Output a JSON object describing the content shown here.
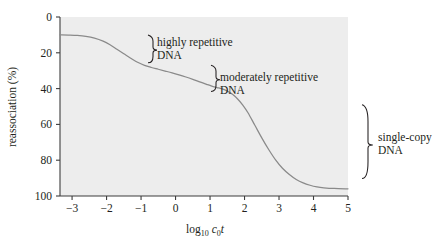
{
  "chart_data": {
    "type": "line",
    "title": "",
    "xlabel": "log10 c0t",
    "ylabel": "reassociation (%)",
    "xlim": [
      -3.35,
      5.0
    ],
    "ylim": [
      0,
      100
    ],
    "y_axis_inverted": true,
    "grid": false,
    "legend_position": "none",
    "xticks": [
      -3,
      -2,
      -1,
      0,
      1,
      2,
      3,
      4,
      5
    ],
    "xtick_labels": [
      "−3",
      "−2",
      "−1",
      "0",
      "1",
      "2",
      "3",
      "4",
      "5"
    ],
    "yticks": [
      0,
      20,
      40,
      60,
      80,
      100
    ],
    "ytick_labels": [
      "0",
      "20",
      "40",
      "60",
      "80",
      "100"
    ],
    "series": [
      {
        "name": "reassociation curve",
        "color": "#8a8a8a",
        "x": [
          -3.35,
          -3.1,
          -2.85,
          -2.6,
          -2.35,
          -2.1,
          -1.9,
          -1.7,
          -1.5,
          -1.3,
          -1.1,
          -0.9,
          -0.7,
          -0.5,
          -0.3,
          -0.1,
          0.1,
          0.3,
          0.5,
          0.7,
          0.9,
          1.05,
          1.2,
          1.35,
          1.5,
          1.65,
          1.8,
          1.95,
          2.1,
          2.3,
          2.5,
          2.7,
          2.9,
          3.1,
          3.3,
          3.5,
          3.7,
          3.9,
          4.1,
          4.3,
          4.6,
          5.0
        ],
        "y": [
          10.0,
          10.1,
          10.3,
          10.8,
          11.8,
          13.5,
          15.5,
          18.0,
          20.5,
          23.0,
          25.3,
          27.0,
          28.2,
          29.2,
          30.2,
          31.2,
          32.3,
          33.5,
          34.8,
          36.2,
          37.6,
          38.6,
          39.4,
          40.2,
          41.4,
          43.2,
          45.8,
          49.2,
          53.5,
          60.5,
          67.5,
          74.0,
          79.8,
          84.5,
          88.0,
          90.8,
          92.7,
          94.0,
          94.9,
          95.4,
          95.8,
          96.0
        ]
      }
    ],
    "annotations": [
      {
        "id": "highly-repetitive",
        "label_line1": "highly repetitive",
        "label_line2": "DNA",
        "brace_y_top": 10,
        "brace_y_bottom": 27
      },
      {
        "id": "moderately-repetitive",
        "label_line1": "moderately repetitive",
        "label_line2": "DNA",
        "brace_y_top": 27,
        "brace_y_bottom": 43
      },
      {
        "id": "single-copy",
        "label_line1": "single-copy",
        "label_line2": "DNA",
        "brace_y_top": 49,
        "brace_y_bottom": 94
      }
    ],
    "plot_background": "#ededed",
    "axis_color": "#3d3d3d",
    "curve_color": "#8a8a8a"
  },
  "axis_labels": {
    "y_title": "reassociation (%)",
    "x_title_base": "log",
    "x_title_sub1": "10",
    "x_title_var1": "c",
    "x_title_sub2": "0",
    "x_title_var2": "t"
  }
}
